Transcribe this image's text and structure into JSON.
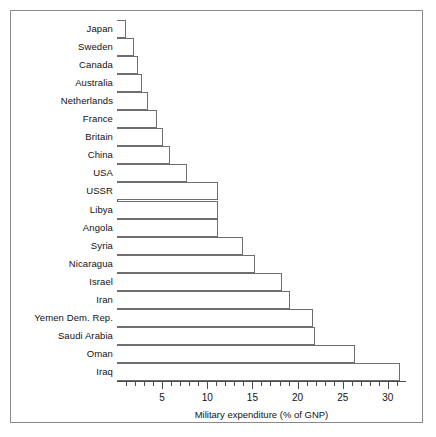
{
  "chart_data": {
    "type": "bar",
    "orientation": "horizontal",
    "title": "",
    "xlabel": "Military expenditure (% of GNP)",
    "ylabel": "",
    "xlim": [
      0,
      31.9
    ],
    "xticks": [
      5,
      10,
      15,
      20,
      25,
      30
    ],
    "xtick_labels": [
      "5",
      "10",
      "15",
      "20",
      "25",
      "30"
    ],
    "minor_tick_step": 1,
    "grid": false,
    "legend": null,
    "categories": [
      "Japan",
      "Sweden",
      "Canada",
      "Australia",
      "Netherlands",
      "France",
      "Britain",
      "China",
      "USA",
      "USSR",
      "Libya",
      "Angola",
      "Syria",
      "Nicaragua",
      "Israel",
      "Iran",
      "Yemen Dem. Rep.",
      "Saudi Arabia",
      "Oman",
      "Iraq"
    ],
    "values": [
      1.0,
      1.9,
      2.3,
      2.8,
      3.4,
      4.4,
      5.1,
      5.9,
      7.8,
      11.2,
      11.2,
      11.2,
      14.0,
      15.3,
      18.3,
      19.2,
      21.7,
      21.9,
      26.4,
      31.3
    ],
    "bar_face_color": "#ffffff",
    "bar_edge_color": "#6e6e6e",
    "axis_color": "#4a4a4a",
    "text_color": "#111111",
    "background_color": "#ffffff",
    "frame_color": "#8a8a8a"
  }
}
